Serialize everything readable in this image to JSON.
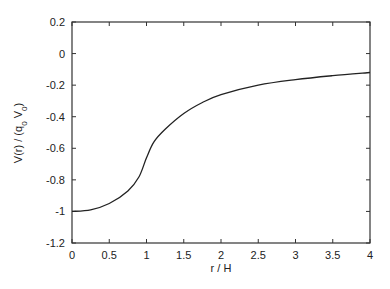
{
  "chart_data": {
    "type": "line",
    "title": "",
    "xlabel": "r / H",
    "ylabel": "V(r) / (q0 V0)",
    "ylabel_parts": {
      "main": "V(r) / (q",
      "sub1": "0",
      "mid": " V",
      "sub2": "0",
      "end": ")"
    },
    "xlim": [
      0,
      4
    ],
    "ylim": [
      -1.2,
      0.2
    ],
    "x_ticks": [
      0,
      0.5,
      1,
      1.5,
      2,
      2.5,
      3,
      3.5,
      4
    ],
    "x_tick_labels": [
      "0",
      "0.5",
      "1",
      "1.5",
      "2",
      "2.5",
      "3",
      "3.5",
      "4"
    ],
    "y_ticks": [
      0.2,
      0,
      -0.2,
      -0.4,
      -0.6,
      -0.8,
      -1,
      -1.2
    ],
    "y_tick_labels": [
      "0.2",
      "0",
      "-0.2",
      "-0.4",
      "-0.6",
      "-0.8",
      "-1",
      "-1.2"
    ],
    "grid": false,
    "legend": null,
    "series": [
      {
        "name": "V(r)",
        "color": "#222222",
        "x": [
          0,
          0.25,
          0.5,
          0.75,
          0.9,
          1.0,
          1.1,
          1.25,
          1.5,
          1.75,
          2.0,
          2.5,
          3.0,
          3.5,
          4.0
        ],
        "y": [
          -1.0,
          -0.99,
          -0.95,
          -0.87,
          -0.78,
          -0.66,
          -0.56,
          -0.48,
          -0.38,
          -0.31,
          -0.26,
          -0.2,
          -0.165,
          -0.14,
          -0.12
        ]
      }
    ]
  }
}
